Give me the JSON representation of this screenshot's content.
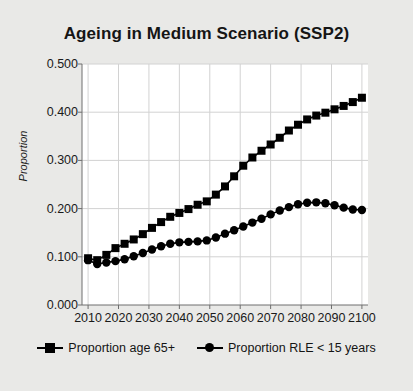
{
  "chart_data": {
    "type": "line",
    "title": "Ageing in Medium Scenario (SSP2)",
    "xlabel": "",
    "ylabel": "Proportion",
    "xlim": [
      2008,
      2102
    ],
    "ylim": [
      0.0,
      0.5
    ],
    "grid": true,
    "legend_position": "bottom",
    "xticks": [
      "2010",
      "2020",
      "2030",
      "2040",
      "2050",
      "2060",
      "2070",
      "2080",
      "2090",
      "2100"
    ],
    "xtick_values": [
      2010,
      2020,
      2030,
      2040,
      2050,
      2060,
      2070,
      2080,
      2090,
      2100
    ],
    "yticks": [
      "0.000",
      "0.100",
      "0.200",
      "0.300",
      "0.400",
      "0.500"
    ],
    "ytick_values": [
      0.0,
      0.1,
      0.2,
      0.3,
      0.4,
      0.5
    ],
    "x": [
      2010,
      2013,
      2016,
      2019,
      2022,
      2025,
      2028,
      2031,
      2034,
      2037,
      2040,
      2043,
      2046,
      2049,
      2052,
      2055,
      2058,
      2061,
      2064,
      2067,
      2070,
      2073,
      2076,
      2079,
      2082,
      2085,
      2088,
      2091,
      2094,
      2097,
      2100
    ],
    "series": [
      {
        "name": "Proportion age 65+",
        "marker": "square",
        "color": "#000000",
        "values": [
          0.097,
          0.093,
          0.104,
          0.118,
          0.127,
          0.136,
          0.147,
          0.16,
          0.172,
          0.183,
          0.191,
          0.199,
          0.208,
          0.215,
          0.229,
          0.246,
          0.267,
          0.289,
          0.306,
          0.32,
          0.333,
          0.347,
          0.362,
          0.374,
          0.385,
          0.393,
          0.399,
          0.406,
          0.413,
          0.421,
          0.43
        ]
      },
      {
        "name": "Proportion RLE < 15 years",
        "marker": "circle",
        "color": "#000000",
        "values": [
          0.093,
          0.085,
          0.088,
          0.091,
          0.095,
          0.101,
          0.108,
          0.115,
          0.122,
          0.127,
          0.13,
          0.131,
          0.132,
          0.134,
          0.14,
          0.148,
          0.155,
          0.163,
          0.171,
          0.179,
          0.188,
          0.196,
          0.203,
          0.209,
          0.212,
          0.213,
          0.211,
          0.207,
          0.202,
          0.198,
          0.197
        ]
      }
    ]
  }
}
